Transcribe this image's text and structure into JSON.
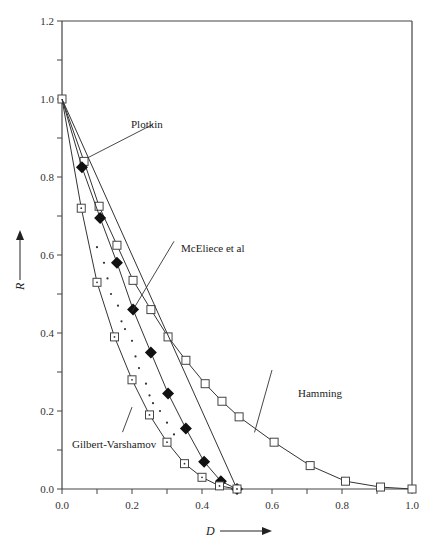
{
  "chart_data": {
    "type": "line",
    "title": "",
    "xlabel": "D",
    "ylabel": "R",
    "xlim": [
      0.0,
      1.0
    ],
    "ylim": [
      0.0,
      1.2
    ],
    "x_ticks": [
      "0.0",
      "0.2",
      "0.4",
      "0.6",
      "0.8",
      "1.0"
    ],
    "y_ticks": [
      "0.0",
      "0.2",
      "0.4",
      "0.6",
      "0.8",
      "1.0",
      "1.2"
    ],
    "grid": false,
    "legend": "annotations",
    "series": [
      {
        "name": "Hamming",
        "marker": "open-square",
        "x": [
          0.0,
          0.063,
          0.106,
          0.157,
          0.203,
          0.254,
          0.303,
          0.354,
          0.409,
          0.457,
          0.506,
          0.606,
          0.709,
          0.81,
          0.91,
          1.0
        ],
        "y": [
          1.0,
          0.84,
          0.725,
          0.625,
          0.535,
          0.46,
          0.39,
          0.33,
          0.27,
          0.225,
          0.185,
          0.12,
          0.06,
          0.02,
          0.005,
          0.0
        ]
      },
      {
        "name": "Plotkin",
        "marker": "none",
        "x": [
          0.0,
          0.5
        ],
        "y": [
          1.0,
          0.0
        ]
      },
      {
        "name": "McEliece et al",
        "marker": "filled-diamond",
        "x": [
          0.0,
          0.057,
          0.109,
          0.157,
          0.203,
          0.254,
          0.303,
          0.354,
          0.406,
          0.454,
          0.5
        ],
        "y": [
          1.0,
          0.825,
          0.695,
          0.58,
          0.46,
          0.35,
          0.245,
          0.155,
          0.07,
          0.02,
          0.0
        ]
      },
      {
        "name": "Gilbert-Varshamov",
        "marker": "open-square-dot",
        "x": [
          0.0,
          0.055,
          0.1,
          0.15,
          0.2,
          0.25,
          0.3,
          0.35,
          0.4,
          0.45,
          0.5
        ],
        "y": [
          1.0,
          0.72,
          0.53,
          0.39,
          0.28,
          0.19,
          0.12,
          0.065,
          0.03,
          0.008,
          0.0
        ]
      },
      {
        "name": "dotted-region",
        "marker": "dot",
        "x": [
          0.1,
          0.12,
          0.13,
          0.14,
          0.16,
          0.17,
          0.18,
          0.2,
          0.21,
          0.22,
          0.24,
          0.25,
          0.26,
          0.28,
          0.3,
          0.32
        ],
        "y": [
          0.62,
          0.58,
          0.54,
          0.5,
          0.47,
          0.43,
          0.41,
          0.38,
          0.34,
          0.31,
          0.27,
          0.24,
          0.22,
          0.2,
          0.17,
          0.14
        ]
      }
    ],
    "annotations": [
      {
        "text": "Plotkin",
        "at": [
          0.26,
          0.93
        ],
        "points_to": [
          0.075,
          0.85
        ]
      },
      {
        "text": "McEliece et al",
        "at": [
          0.32,
          0.63
        ],
        "points_to": [
          0.2,
          0.455
        ]
      },
      {
        "text": "Hamming",
        "at": [
          0.6,
          0.3
        ],
        "points_to": [
          0.55,
          0.145
        ]
      },
      {
        "text": "Gilbert-Varshamov",
        "at": [
          0.03,
          0.115
        ],
        "points_to": [
          0.2,
          0.21
        ]
      }
    ]
  },
  "labels": {
    "x_axis_title": "D",
    "y_axis_title": "R",
    "ann_plotkin": "Plotkin",
    "ann_mceliece": "McEliece et al",
    "ann_hamming": "Hamming",
    "ann_gv": "Gilbert-Varshamov"
  }
}
